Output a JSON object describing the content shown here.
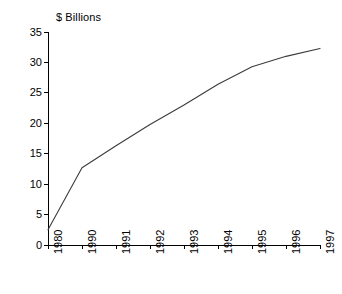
{
  "chart_data": {
    "type": "line",
    "title": "$ Billions",
    "xlabel": "",
    "ylabel": "",
    "grid": false,
    "legend": "none",
    "line_color": "#3c3c3c",
    "axis_color": "#000000",
    "categories": [
      "1980",
      "1990",
      "1991",
      "1992",
      "1993",
      "1994",
      "1995",
      "1996",
      "1997"
    ],
    "values": [
      2.5,
      12.7,
      16.3,
      19.8,
      23.0,
      26.4,
      29.3,
      31.0,
      32.3
    ],
    "series": [
      {
        "name": "$ Billions",
        "values": [
          2.5,
          12.7,
          16.3,
          19.8,
          23.0,
          26.4,
          29.3,
          31.0,
          32.3
        ]
      }
    ],
    "ylim": [
      0,
      35
    ],
    "yticks": [
      0,
      5,
      10,
      15,
      20,
      25,
      30,
      35
    ],
    "ytick_labels": [
      "0",
      "5",
      "10",
      "15",
      "20",
      "25",
      "30",
      "35"
    ],
    "xtick_labels": [
      "1980",
      "1990",
      "1991",
      "1992",
      "1993",
      "1994",
      "1995",
      "1996",
      "1997"
    ]
  }
}
